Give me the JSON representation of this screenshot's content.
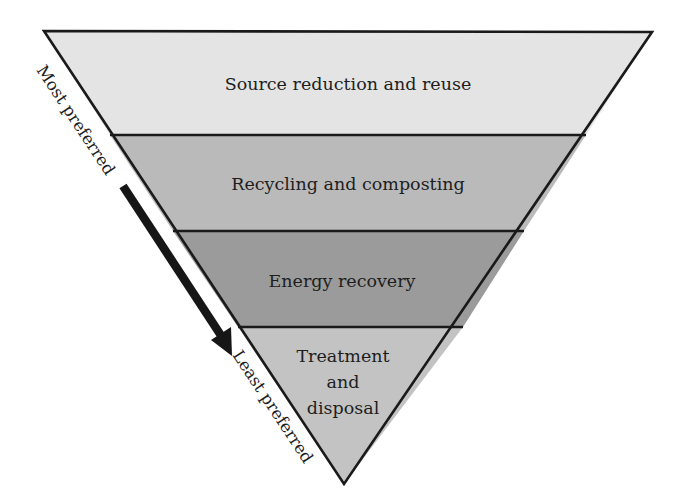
{
  "bands": [
    {
      "label_lines": [
        "Source reduction and reuse"
      ],
      "color": "#e4e4e4"
    },
    {
      "label_lines": [
        "Recycling and composting"
      ],
      "color": "#bababa"
    },
    {
      "label_lines": [
        "Energy recovery"
      ],
      "color": "#9b9b9b"
    },
    {
      "label_lines": [
        "Treatment",
        "and",
        "disposal"
      ],
      "color": "#c3c3c3"
    }
  ],
  "side_labels": {
    "top": "Most preferred",
    "bottom": "Least preferred"
  },
  "arrow": {
    "direction": "down",
    "meaning": "decreasing preference",
    "color": "#161616"
  },
  "outline_color": "#1a1a1a"
}
